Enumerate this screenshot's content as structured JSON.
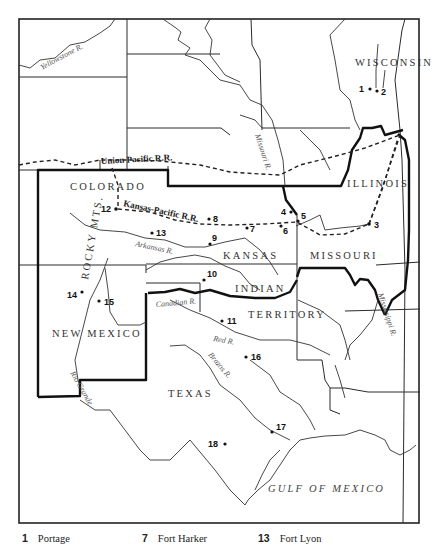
{
  "map": {
    "states": {
      "wisconsin": "WISCONSIN",
      "illinois": "ILLINOIS",
      "colorado": "COLORADO",
      "kansas": "KANSAS",
      "missouri": "MISSOURI",
      "indian": "INDIAN",
      "territory": "TERRITORY",
      "new_mexico": "NEW MEXICO",
      "texas": "TEXAS"
    },
    "regions": {
      "rocky_mts": "ROCKY MTS.",
      "gulf": "GULF OF MEXICO"
    },
    "rivers": {
      "yellowstone": "Yellowstone R.",
      "missouri": "Missouri R.",
      "arkansas": "Arkansas R.",
      "canadian": "Canadian R.",
      "red": "Red R.",
      "brazos": "Brazos R.",
      "rio_grande": "Rio Grande",
      "mississippi": "Mississippi R."
    },
    "railroads": {
      "union_pacific": "Union Pacific R.R.",
      "kansas_pacific": "Kansas-Pacific R.R."
    },
    "points": [
      {
        "n": "1",
        "x": 384,
        "y": 89
      },
      {
        "n": "2",
        "x": 377,
        "y": 91
      },
      {
        "n": "3",
        "x": 369,
        "y": 224
      },
      {
        "n": "4",
        "x": 291,
        "y": 212
      },
      {
        "n": "5",
        "x": 296,
        "y": 219
      },
      {
        "n": "6",
        "x": 281,
        "y": 226
      },
      {
        "n": "7",
        "x": 246,
        "y": 228
      },
      {
        "n": "8",
        "x": 209,
        "y": 219
      },
      {
        "n": "9",
        "x": 210,
        "y": 244
      },
      {
        "n": "10",
        "x": 204,
        "y": 253
      },
      {
        "n": "11",
        "x": 221,
        "y": 320
      },
      {
        "n": "12",
        "x": 116,
        "y": 209
      },
      {
        "n": "13",
        "x": 152,
        "y": 233
      },
      {
        "n": "14",
        "x": 82,
        "y": 293
      },
      {
        "n": "15",
        "x": 99,
        "y": 301
      },
      {
        "n": "16",
        "x": 246,
        "y": 357
      },
      {
        "n": "17",
        "x": 302,
        "y": 431
      },
      {
        "n": "18",
        "x": 225,
        "y": 444
      }
    ]
  },
  "legend": [
    {
      "n": "1",
      "name": "Portage"
    },
    {
      "n": "7",
      "name": "Fort Harker"
    },
    {
      "n": "13",
      "name": "Fort Lyon"
    }
  ]
}
